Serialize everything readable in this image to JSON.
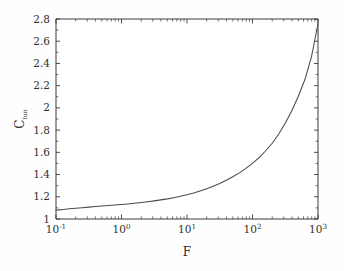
{
  "chart_data": {
    "type": "line",
    "title": "",
    "xlabel": "F",
    "ylabel": "C_tun",
    "ylabel_base": "C",
    "ylabel_sub": "tun",
    "xscale": "log",
    "yscale": "linear",
    "xlim": [
      0.1,
      1000
    ],
    "ylim": [
      1.0,
      2.8
    ],
    "grid": false,
    "legend": null,
    "line_color": "#4a4a4a",
    "xtick_labels": [
      "10^-1",
      "10^0",
      "10^1",
      "10^2",
      "10^3"
    ],
    "xtick_mantissa": [
      "10",
      "10",
      "10",
      "10",
      "10"
    ],
    "xtick_exponents": [
      "-1",
      "0",
      "1",
      "2",
      "3"
    ],
    "xtick_values": [
      0.1,
      1,
      10,
      100,
      1000
    ],
    "ytick_labels": [
      "1",
      "1.2",
      "1.4",
      "1.6",
      "1.8",
      "2",
      "2.2",
      "2.4",
      "2.6",
      "2.8"
    ],
    "ytick_values": [
      1,
      1.2,
      1.4,
      1.6,
      1.8,
      2,
      2.2,
      2.4,
      2.6,
      2.8
    ],
    "series": [
      {
        "name": "C_tun vs F",
        "x": [
          0.1,
          0.13,
          0.16,
          0.2,
          0.25,
          0.32,
          0.4,
          0.5,
          0.63,
          0.79,
          1.0,
          1.26,
          1.58,
          2.0,
          2.51,
          3.16,
          3.98,
          5.01,
          6.31,
          7.94,
          10.0,
          12.6,
          15.8,
          20.0,
          25.1,
          31.6,
          39.8,
          50.1,
          63.1,
          79.4,
          100.0,
          126.0,
          158.0,
          200.0,
          251.0,
          316.0,
          398.0,
          501.0,
          631.0,
          794.0,
          1000.0
        ],
        "y": [
          1.08,
          1.086,
          1.092,
          1.097,
          1.102,
          1.107,
          1.112,
          1.117,
          1.122,
          1.126,
          1.13,
          1.135,
          1.141,
          1.148,
          1.155,
          1.163,
          1.172,
          1.181,
          1.192,
          1.204,
          1.218,
          1.234,
          1.252,
          1.272,
          1.295,
          1.32,
          1.348,
          1.38,
          1.415,
          1.455,
          1.5,
          1.552,
          1.612,
          1.682,
          1.765,
          1.862,
          1.975,
          2.105,
          2.255,
          2.46,
          2.755
        ]
      }
    ],
    "annotations": []
  },
  "figure": {
    "background_color": "#fefefe",
    "axes_color": "#3a3a3a"
  }
}
